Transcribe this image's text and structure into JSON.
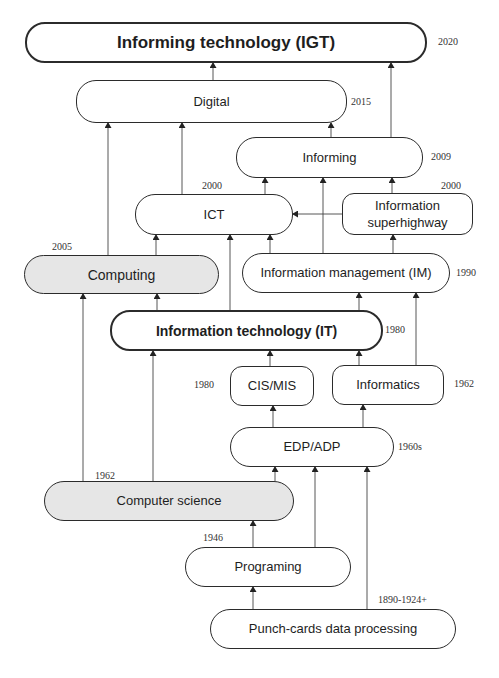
{
  "diagram": {
    "nodes": {
      "igt": {
        "label": "Informing technology (IGT)",
        "year": "2020"
      },
      "digital": {
        "label": "Digital",
        "year": "2015"
      },
      "informing": {
        "label": "Informing",
        "year": "2009"
      },
      "ict": {
        "label": "ICT",
        "year": "2000"
      },
      "superhighway": {
        "label_line1": "Information",
        "label_line2": "superhighway",
        "year": "2000"
      },
      "computing": {
        "label": "Computing",
        "year": "2005"
      },
      "im": {
        "label": "Information management (IM)",
        "year": "1990"
      },
      "it": {
        "label": "Information technology (IT)",
        "year": "1980"
      },
      "cismis": {
        "label": "CIS/MIS",
        "year": "1980"
      },
      "informatics": {
        "label": "Informatics",
        "year": "1962"
      },
      "edp": {
        "label": "EDP/ADP",
        "year": "1960s"
      },
      "cs": {
        "label": "Computer science",
        "year": "1962"
      },
      "programing": {
        "label": "Programing",
        "year": "1946"
      },
      "punch": {
        "label": "Punch-cards data processing",
        "year": "1890-1924+"
      }
    },
    "edges": [
      {
        "from": "Digital",
        "to": "Informing technology (IGT)"
      },
      {
        "from": "Informing",
        "to": "Informing technology (IGT)"
      },
      {
        "from": "Computing",
        "to": "Digital"
      },
      {
        "from": "ICT",
        "to": "Digital"
      },
      {
        "from": "Informing",
        "to": "Digital"
      },
      {
        "from": "ICT",
        "to": "Informing"
      },
      {
        "from": "Information management (IM)",
        "to": "Informing"
      },
      {
        "from": "Information superhighway",
        "to": "Informing"
      },
      {
        "from": "Information superhighway",
        "to": "ICT"
      },
      {
        "from": "Computing",
        "to": "ICT"
      },
      {
        "from": "Information technology (IT)",
        "to": "ICT"
      },
      {
        "from": "Information management (IM)",
        "to": "ICT"
      },
      {
        "from": "Information management (IM)",
        "to": "Information superhighway"
      },
      {
        "from": "Computer science",
        "to": "Computing"
      },
      {
        "from": "Information technology (IT)",
        "to": "Computing"
      },
      {
        "from": "Information technology (IT)",
        "to": "Information management (IM)"
      },
      {
        "from": "Informatics",
        "to": "Information management (IM)"
      },
      {
        "from": "Computer science",
        "to": "Information technology (IT)"
      },
      {
        "from": "CIS/MIS",
        "to": "Information technology (IT)"
      },
      {
        "from": "Informatics",
        "to": "Information technology (IT)"
      },
      {
        "from": "EDP/ADP",
        "to": "CIS/MIS"
      },
      {
        "from": "EDP/ADP",
        "to": "Informatics"
      },
      {
        "from": "Computer science",
        "to": "EDP/ADP"
      },
      {
        "from": "Programing",
        "to": "EDP/ADP"
      },
      {
        "from": "Punch-cards data processing",
        "to": "EDP/ADP"
      },
      {
        "from": "Programing",
        "to": "Computer science"
      },
      {
        "from": "Punch-cards data processing",
        "to": "Programing"
      }
    ]
  }
}
